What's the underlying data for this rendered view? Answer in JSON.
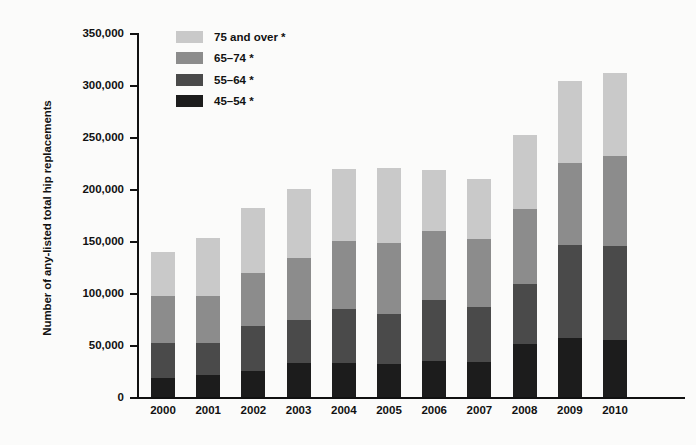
{
  "chart_data": {
    "type": "bar",
    "subtype": "stacked-vertical",
    "title": "",
    "xlabel": "",
    "ylabel": "Number of any-listed total hip replacements",
    "ylim": [
      0,
      350000
    ],
    "ytick_step": 50000,
    "ytick_labels": [
      "350,000",
      "300,000",
      "250,000",
      "200,000",
      "150,000",
      "100,000",
      "50,000",
      "0"
    ],
    "ytick_values": [
      350000,
      300000,
      250000,
      200000,
      150000,
      100000,
      50000,
      0
    ],
    "grid": false,
    "legend_position": "top-left-inside",
    "categories": [
      "2000",
      "2001",
      "2002",
      "2003",
      "2004",
      "2005",
      "2006",
      "2007",
      "2008",
      "2009",
      "2010"
    ],
    "series": [
      {
        "name": "45–54 *",
        "color": "#1c1c1c",
        "stack_order": 1,
        "values": [
          18000,
          21000,
          25000,
          33000,
          33000,
          32000,
          35000,
          34000,
          51000,
          57000,
          55000
        ]
      },
      {
        "name": "55–64 *",
        "color": "#4a4a4a",
        "stack_order": 2,
        "values": [
          34000,
          31000,
          43000,
          41000,
          52000,
          48000,
          58000,
          53000,
          58000,
          89000,
          90000
        ]
      },
      {
        "name": "65–74 *",
        "color": "#8c8c8c",
        "stack_order": 3,
        "values": [
          45000,
          45000,
          51000,
          60000,
          65000,
          68000,
          67000,
          65000,
          72000,
          79000,
          87000
        ]
      },
      {
        "name": "75 and over *",
        "color": "#c9c9c9",
        "stack_order": 4,
        "values": [
          42000,
          56000,
          63000,
          66000,
          69000,
          72000,
          58000,
          58000,
          71000,
          79000,
          80000
        ]
      }
    ],
    "totals": [
      139000,
      153000,
      182000,
      200000,
      219000,
      220000,
      218000,
      210000,
      252000,
      304000,
      312000
    ]
  },
  "legend": {
    "entries": [
      {
        "label": "75 and over *",
        "color": "#c9c9c9"
      },
      {
        "label": "65–74 *",
        "color": "#8c8c8c"
      },
      {
        "label": "55–64 *",
        "color": "#4a4a4a"
      },
      {
        "label": "45–54 *",
        "color": "#1c1c1c"
      }
    ]
  }
}
